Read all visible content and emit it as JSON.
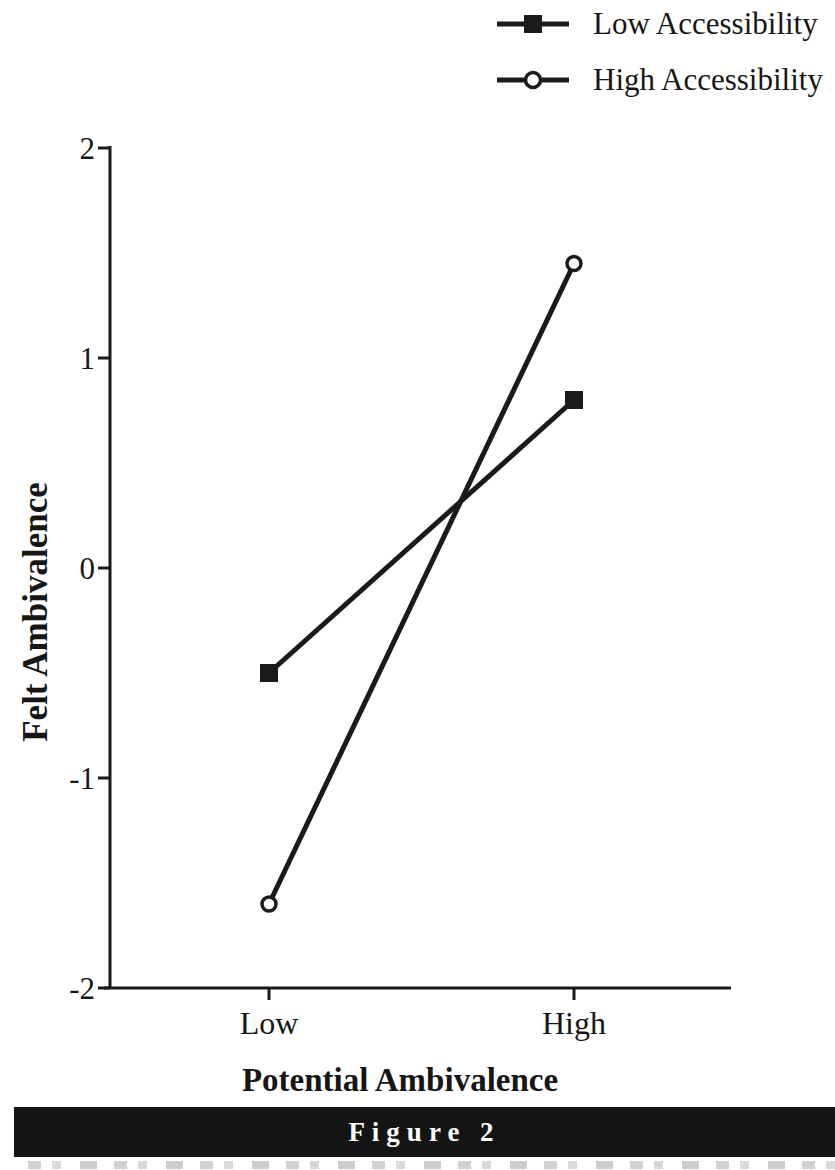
{
  "legend": {
    "items": [
      {
        "label": "Low Accessibility",
        "marker": "filled-square"
      },
      {
        "label": "High Accessibility",
        "marker": "open-circle"
      }
    ]
  },
  "chart_data": {
    "type": "line",
    "categories": [
      "Low",
      "High"
    ],
    "series": [
      {
        "name": "Low Accessibility",
        "marker": "filled-square",
        "values": [
          -0.5,
          0.8
        ]
      },
      {
        "name": "High Accessibility",
        "marker": "open-circle",
        "values": [
          -1.6,
          1.45
        ]
      }
    ],
    "xlabel": "Potential Ambivalence",
    "ylabel": "Felt Ambivalence",
    "ylim": [
      -2,
      2
    ],
    "yticks": [
      "2",
      "1",
      "0",
      "-1",
      "-2"
    ],
    "grid": false,
    "legend_position": "top-right",
    "line_color": "#1a1a1a"
  },
  "figure_caption": {
    "label": "Figure 2",
    "bar_color": "#141414",
    "text_color": "#ffffff"
  }
}
